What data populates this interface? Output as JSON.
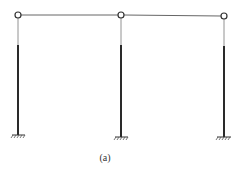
{
  "diagram": {
    "type": "portal frame",
    "caption": "(a)",
    "colors": {
      "line": "#555555",
      "column": "#2a2a2a",
      "background": "#ffffff"
    },
    "beam": {
      "y": 15,
      "x_start": 18,
      "x_end": 224
    },
    "columns": [
      {
        "x": 18,
        "top": 15,
        "thin_end": 45,
        "base": 135,
        "support": "fixed"
      },
      {
        "x": 121,
        "top": 15,
        "thin_end": 45,
        "base": 137,
        "support": "fixed"
      },
      {
        "x": 224,
        "top": 16,
        "thin_end": 46,
        "base": 137,
        "support": "fixed"
      }
    ],
    "hinges": [
      {
        "x": 18,
        "y": 15
      },
      {
        "x": 121,
        "y": 15
      },
      {
        "x": 224,
        "y": 16
      }
    ]
  }
}
